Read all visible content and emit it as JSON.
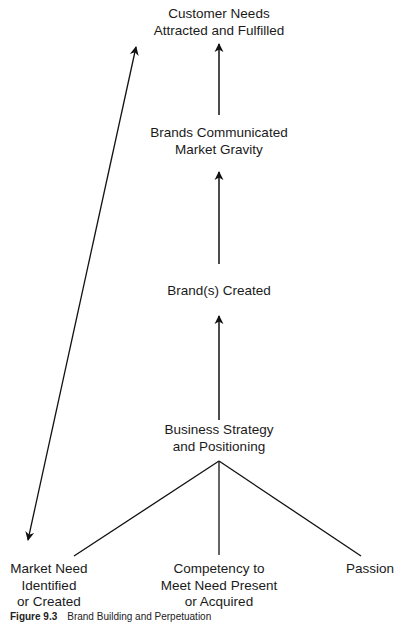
{
  "diagram": {
    "nodes": {
      "customer_needs": {
        "lines": [
          "Customer Needs",
          "Attracted and Fulfilled"
        ]
      },
      "brands_communicated": {
        "lines": [
          "Brands Communicated",
          "Market Gravity"
        ]
      },
      "brands_created": {
        "lines": [
          "Brand(s) Created"
        ]
      },
      "business_strategy": {
        "lines": [
          "Business Strategy",
          "and Positioning"
        ]
      },
      "market_need": {
        "lines": [
          "Market Need",
          "Identified",
          "or Created"
        ]
      },
      "competency": {
        "lines": [
          "Competency to",
          "Meet Need Present",
          "or Acquired"
        ]
      },
      "passion": {
        "lines": [
          "Passion"
        ]
      }
    },
    "edges": [
      {
        "from": "business_strategy",
        "to": "brands_created",
        "type": "arrow"
      },
      {
        "from": "brands_created",
        "to": "brands_communicated",
        "type": "arrow"
      },
      {
        "from": "brands_communicated",
        "to": "customer_needs",
        "type": "arrow"
      },
      {
        "from": "business_strategy",
        "to": "market_need",
        "type": "line"
      },
      {
        "from": "business_strategy",
        "to": "competency",
        "type": "line"
      },
      {
        "from": "business_strategy",
        "to": "passion",
        "type": "line"
      },
      {
        "from": "market_need",
        "to": "customer_needs",
        "type": "double-arrow"
      }
    ],
    "line_color": "#111111"
  },
  "caption": {
    "label": "Figure 9.3",
    "text": "Brand Building and Perpetuation"
  }
}
